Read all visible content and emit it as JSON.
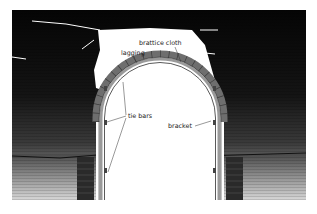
{
  "diagram": {
    "labels": {
      "brattice_cloth": "brattice cloth",
      "lagging": "lagging",
      "tie_bars": "tie bars",
      "bracket": "bracket"
    },
    "colors": {
      "rock_dark": "#0a0a0a",
      "rock_mid": "#3a3a3a",
      "rock_light": "#bdbdbd",
      "steel": "#8a8a8a",
      "lagging": "#6e6e6e",
      "background": "#ffffff"
    }
  }
}
